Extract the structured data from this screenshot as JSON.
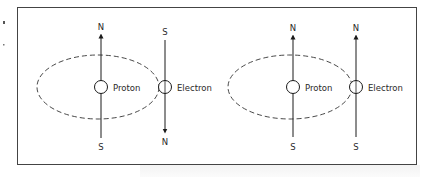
{
  "figure": {
    "frame": {
      "x": 17,
      "y": 7,
      "width": 399,
      "height": 157,
      "stroke": "#444444"
    },
    "panels": [
      {
        "id": "antiparallel",
        "orbit": {
          "cx": 95,
          "cy": 88,
          "rx": 67,
          "ry": 32
        },
        "proton": {
          "label": "Proton",
          "cx": 101,
          "cy": 87,
          "r": 6,
          "top_pole": "N",
          "bottom_pole": "S",
          "arrow": "up"
        },
        "electron": {
          "label": "Electron",
          "cx": 165,
          "cy": 87,
          "r": 6,
          "top_pole": "S",
          "bottom_pole": "N",
          "arrow": "down"
        }
      },
      {
        "id": "parallel",
        "orbit": {
          "cx": 286,
          "cy": 88,
          "rx": 67,
          "ry": 32
        },
        "proton": {
          "label": "Proton",
          "cx": 293,
          "cy": 87,
          "r": 6,
          "top_pole": "N",
          "bottom_pole": "S",
          "arrow": "up"
        },
        "electron": {
          "label": "Electron",
          "cx": 356,
          "cy": 87,
          "r": 6,
          "top_pole": "N",
          "bottom_pole": "S",
          "arrow": "up"
        }
      }
    ]
  }
}
